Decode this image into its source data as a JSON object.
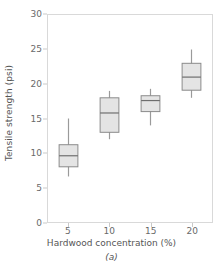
{
  "chart_data": {
    "type": "box",
    "title": "",
    "subtitle": "",
    "caption": "(a)",
    "xlabel": "Hardwood concentration (%)",
    "ylabel": "Tensile strength (psi)",
    "categories": [
      "5",
      "10",
      "15",
      "20"
    ],
    "xtick_labels": [
      "5",
      "10",
      "15",
      "20"
    ],
    "ytick_labels": [
      "0",
      "5",
      "10",
      "15",
      "20",
      "25",
      "30"
    ],
    "ytick_values": [
      0,
      5,
      10,
      15,
      20,
      25,
      30
    ],
    "ylim": [
      0,
      30
    ],
    "grid": false,
    "legend": "none",
    "box_fill_color": "#e4e4e4",
    "box_edge_color": "#8a8a8a",
    "median_color": "#6e6e6e",
    "whisker_color": "#9a9a9a",
    "axis_color": "#d9d9d9",
    "boxes": [
      {
        "category": "5",
        "whisker_low": 6.6,
        "q1": 8.0,
        "median": 9.6,
        "q3": 11.2,
        "whisker_high": 15.0
      },
      {
        "category": "10",
        "whisker_low": 12.0,
        "q1": 13.0,
        "median": 15.8,
        "q3": 18.0,
        "whisker_high": 19.0
      },
      {
        "category": "15",
        "whisker_low": 14.0,
        "q1": 16.0,
        "median": 17.6,
        "q3": 18.3,
        "whisker_high": 19.3
      },
      {
        "category": "20",
        "whisker_low": 18.0,
        "q1": 19.1,
        "median": 21.0,
        "q3": 23.0,
        "whisker_high": 25.0
      }
    ]
  }
}
